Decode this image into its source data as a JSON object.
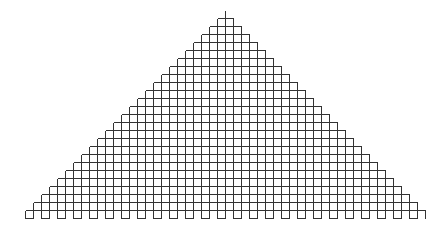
{
  "diagram": {
    "type": "staircase-triangle-grid",
    "apex_x": 225,
    "apex_top_y": 10,
    "top_y": 18,
    "cell_size": 8,
    "rows": 24,
    "top_row_cells": 2,
    "growth_per_side_per_row": 1,
    "bottom_teeth_row": true,
    "teeth_height": 8,
    "stroke_color": "#333333",
    "background": "#ffffff"
  }
}
